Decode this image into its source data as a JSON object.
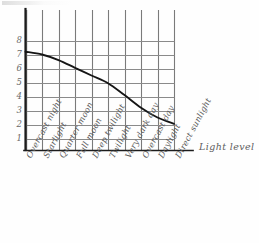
{
  "chart_data": {
    "type": "line",
    "title": "",
    "xlabel": "Light level",
    "ylabel": "",
    "grid": true,
    "legend": false,
    "style": "hand-drawn",
    "categories": [
      "Overcast night",
      "Starlight",
      "Quarter moon",
      "Full moon",
      "Deep twilight",
      "Twilight",
      "Very dark day",
      "Overcast day",
      "Daylight",
      "Direct sunlight"
    ],
    "yticks": [
      "8",
      "7",
      "6",
      "5",
      "4",
      "3",
      "2",
      "1"
    ],
    "ylim": [
      0,
      8.6
    ],
    "values": [
      7.2,
      7.0,
      6.6,
      6.05,
      5.5,
      4.95,
      4.1,
      3.2,
      2.5,
      2.05
    ],
    "series": [
      {
        "name": "",
        "values": [
          7.2,
          7.0,
          6.6,
          6.05,
          5.5,
          4.95,
          4.1,
          3.2,
          2.5,
          2.05
        ]
      }
    ]
  },
  "axes": {
    "x_title": "Light level",
    "y_tick_labels": [
      "8",
      "7",
      "6",
      "5",
      "4",
      "3",
      "2",
      "1"
    ],
    "x_tick_labels": [
      "Overcast night",
      "Starlight",
      "Quarter moon",
      "Full moon",
      "Deep twilight",
      "Twilight",
      "Very dark day",
      "Overcast day",
      "Daylight",
      "Direct sunlight"
    ]
  },
  "colors": {
    "background": "#fefefe",
    "spine": "#1c1c1c",
    "grid": "#7d7d7d",
    "curve": "#151515",
    "text": "#5a5a5a"
  }
}
